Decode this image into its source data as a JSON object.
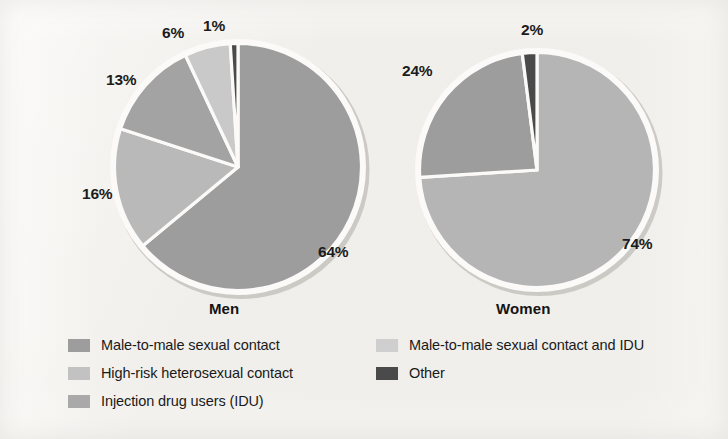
{
  "figure": {
    "background_color": "#f1efeb",
    "charts": [
      {
        "id": "men",
        "title": "Men",
        "center": [
          146,
          167
        ],
        "radius": 128,
        "slices": [
          {
            "label": "Male-to-male sexual contact",
            "value": 64,
            "display": "64%",
            "color": "#9d9d9d"
          },
          {
            "label": "High-risk heterosexual contact",
            "value": 16,
            "display": "16%",
            "color": "#b9b9b9"
          },
          {
            "label": "Injection drug users (IDU)",
            "value": 13,
            "display": "13%",
            "color": "#a3a3a3"
          },
          {
            "label": "Male-to-male sexual contact and IDU",
            "value": 6,
            "display": "6%",
            "color": "#c9c9c9"
          },
          {
            "label": "Other",
            "value": 1,
            "display": "1%",
            "color": "#4a4a4a"
          }
        ]
      },
      {
        "id": "women",
        "title": "Women",
        "center": [
          137,
          170
        ],
        "radius": 122,
        "slices": [
          {
            "label": "High-risk heterosexual contact",
            "value": 74,
            "display": "74%",
            "color": "#b5b5b5"
          },
          {
            "label": "Injection drug users (IDU)",
            "value": 24,
            "display": "24%",
            "color": "#9d9d9d"
          },
          {
            "label": "Other",
            "value": 2,
            "display": "2%",
            "color": "#4a4a4a"
          }
        ]
      }
    ],
    "legend": {
      "left_column": [
        {
          "label": "Male-to-male sexual contact",
          "color": "#9d9d9d"
        },
        {
          "label": "High-risk heterosexual contact",
          "color": "#c2c2c2"
        },
        {
          "label": "Injection drug users (IDU)",
          "color": "#a9a9a9"
        }
      ],
      "right_column": [
        {
          "label": "Male-to-male sexual contact and IDU",
          "color": "#cfcfcf"
        },
        {
          "label": "Other",
          "color": "#4a4a4a"
        }
      ]
    }
  },
  "chart_data": {
    "type": "pie",
    "title": "",
    "subtitle": "",
    "charts": [
      {
        "name": "Men",
        "categories": [
          "Male-to-male sexual contact",
          "High-risk heterosexual contact",
          "Injection drug users (IDU)",
          "Male-to-male sexual contact and IDU",
          "Other"
        ],
        "values": [
          64,
          16,
          13,
          6,
          1
        ],
        "value_labels": [
          "64%",
          "16%",
          "13%",
          "6%",
          "1%"
        ],
        "units": "percent",
        "total": 100,
        "colors": [
          "#9d9d9d",
          "#b9b9b9",
          "#a3a3a3",
          "#c9c9c9",
          "#4a4a4a"
        ],
        "start_angle_deg": 0,
        "direction": "clockwise"
      },
      {
        "name": "Women",
        "categories": [
          "High-risk heterosexual contact",
          "Injection drug users (IDU)",
          "Other"
        ],
        "values": [
          74,
          24,
          2
        ],
        "value_labels": [
          "74%",
          "24%",
          "2%"
        ],
        "units": "percent",
        "total": 100,
        "colors": [
          "#b5b5b5",
          "#9d9d9d",
          "#4a4a4a"
        ],
        "start_angle_deg": 0,
        "direction": "clockwise"
      }
    ],
    "legend": {
      "position": "bottom",
      "entries": [
        {
          "label": "Male-to-male sexual contact",
          "color": "#9d9d9d"
        },
        {
          "label": "Male-to-male sexual contact and IDU",
          "color": "#cfcfcf"
        },
        {
          "label": "High-risk heterosexual contact",
          "color": "#c2c2c2"
        },
        {
          "label": "Other",
          "color": "#4a4a4a"
        },
        {
          "label": "Injection drug users (IDU)",
          "color": "#a9a9a9"
        }
      ]
    },
    "grid": false,
    "xlabel": "",
    "ylabel": ""
  }
}
